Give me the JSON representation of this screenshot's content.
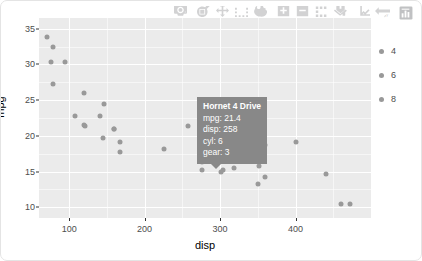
{
  "chart_data": {
    "type": "scatter",
    "title": "",
    "xlabel": "disp",
    "ylabel": "mpg",
    "xlim": [
      60,
      500
    ],
    "ylim": [
      8.5,
      36.5
    ],
    "xticks": [
      "100",
      "200",
      "300",
      "400"
    ],
    "xtick_values": [
      100,
      200,
      300,
      400
    ],
    "yticks": [
      "35",
      "30",
      "25",
      "20",
      "15",
      "10"
    ],
    "ytick_values": [
      35,
      30,
      25,
      20,
      15,
      10
    ],
    "grid": true,
    "legend_position": "right",
    "legend_title": "",
    "series": [
      {
        "name": "4",
        "color": "#999999",
        "points": [
          {
            "label": "Datsun 710",
            "disp": 108,
            "mpg": 22.8,
            "cyl": 4,
            "gear": 4
          },
          {
            "label": "Merc 240D",
            "disp": 146.7,
            "mpg": 24.4,
            "cyl": 4,
            "gear": 4
          },
          {
            "label": "Merc 230",
            "disp": 140.8,
            "mpg": 22.8,
            "cyl": 4,
            "gear": 4
          },
          {
            "label": "Fiat 128",
            "disp": 78.7,
            "mpg": 32.4,
            "cyl": 4,
            "gear": 4
          },
          {
            "label": "Honda Civic",
            "disp": 75.7,
            "mpg": 30.4,
            "cyl": 4,
            "gear": 4
          },
          {
            "label": "Toyota Corolla",
            "disp": 71.1,
            "mpg": 33.9,
            "cyl": 4,
            "gear": 4
          },
          {
            "label": "Toyota Corona",
            "disp": 120.1,
            "mpg": 21.5,
            "cyl": 4,
            "gear": 3
          },
          {
            "label": "Fiat X1-9",
            "disp": 79,
            "mpg": 27.3,
            "cyl": 4,
            "gear": 4
          },
          {
            "label": "Porsche 914-2",
            "disp": 120.3,
            "mpg": 26,
            "cyl": 4,
            "gear": 5
          },
          {
            "label": "Lotus Europa",
            "disp": 95.1,
            "mpg": 30.4,
            "cyl": 4,
            "gear": 5
          },
          {
            "label": "Volvo 142E",
            "disp": 121,
            "mpg": 21.4,
            "cyl": 4,
            "gear": 4
          }
        ]
      },
      {
        "name": "6",
        "color": "#999999",
        "points": [
          {
            "label": "Mazda RX4",
            "disp": 160,
            "mpg": 21,
            "cyl": 6,
            "gear": 4
          },
          {
            "label": "Mazda RX4 Wag",
            "disp": 160,
            "mpg": 21,
            "cyl": 6,
            "gear": 4
          },
          {
            "label": "Hornet 4 Drive",
            "disp": 258,
            "mpg": 21.4,
            "cyl": 6,
            "gear": 3
          },
          {
            "label": "Valiant",
            "disp": 225,
            "mpg": 18.1,
            "cyl": 6,
            "gear": 3
          },
          {
            "label": "Merc 280",
            "disp": 167.6,
            "mpg": 19.2,
            "cyl": 6,
            "gear": 4
          },
          {
            "label": "Merc 280C",
            "disp": 167.6,
            "mpg": 17.8,
            "cyl": 6,
            "gear": 4
          },
          {
            "label": "Ferrari Dino",
            "disp": 145,
            "mpg": 19.7,
            "cyl": 6,
            "gear": 5
          }
        ]
      },
      {
        "name": "8",
        "color": "#999999",
        "points": [
          {
            "label": "Hornet Sportabout",
            "disp": 360,
            "mpg": 18.7,
            "cyl": 8,
            "gear": 3
          },
          {
            "label": "Duster 360",
            "disp": 360,
            "mpg": 14.3,
            "cyl": 8,
            "gear": 3
          },
          {
            "label": "Merc 450SE",
            "disp": 275.8,
            "mpg": 16.4,
            "cyl": 8,
            "gear": 3
          },
          {
            "label": "Merc 450SL",
            "disp": 275.8,
            "mpg": 17.3,
            "cyl": 8,
            "gear": 3
          },
          {
            "label": "Merc 450SLC",
            "disp": 275.8,
            "mpg": 15.2,
            "cyl": 8,
            "gear": 3
          },
          {
            "label": "Cadillac Fleetwood",
            "disp": 472,
            "mpg": 10.4,
            "cyl": 8,
            "gear": 3
          },
          {
            "label": "Lincoln Continental",
            "disp": 460,
            "mpg": 10.4,
            "cyl": 8,
            "gear": 3
          },
          {
            "label": "Chrysler Imperial",
            "disp": 440,
            "mpg": 14.7,
            "cyl": 8,
            "gear": 3
          },
          {
            "label": "Dodge Challenger",
            "disp": 318,
            "mpg": 15.5,
            "cyl": 8,
            "gear": 3
          },
          {
            "label": "AMC Javelin",
            "disp": 304,
            "mpg": 15.2,
            "cyl": 8,
            "gear": 3
          },
          {
            "label": "Camaro Z28",
            "disp": 350,
            "mpg": 13.3,
            "cyl": 8,
            "gear": 3
          },
          {
            "label": "Pontiac Firebird",
            "disp": 400,
            "mpg": 19.2,
            "cyl": 8,
            "gear": 3
          },
          {
            "label": "Ford Pantera L",
            "disp": 351,
            "mpg": 15.8,
            "cyl": 8,
            "gear": 5
          },
          {
            "label": "Maserati Bora",
            "disp": 301,
            "mpg": 15,
            "cyl": 8,
            "gear": 5
          }
        ]
      }
    ]
  },
  "legend": {
    "items": [
      {
        "label": "4",
        "color": "#999999"
      },
      {
        "label": "6",
        "color": "#999999"
      },
      {
        "label": "8",
        "color": "#999999"
      }
    ]
  },
  "tooltip": {
    "title": "Hornet 4 Drive",
    "line_mpg": "mpg: 21.4",
    "line_disp": "disp: 258",
    "line_cyl": "cyl: 6",
    "line_gear": "gear: 3",
    "background": "#888888"
  },
  "modebar": {
    "buttons": [
      {
        "name": "camera-icon",
        "title": "Download plot as a png"
      },
      {
        "name": "zoom-magnifier-icon",
        "title": "Zoom"
      },
      {
        "name": "pan-move-icon",
        "title": "Pan"
      },
      {
        "name": "box-select-icon",
        "title": "Box Select"
      },
      {
        "name": "lasso-select-icon",
        "title": "Lasso Select"
      },
      {
        "name": "zoom-in-icon",
        "title": "Zoom in"
      },
      {
        "name": "zoom-out-icon",
        "title": "Zoom out"
      },
      {
        "name": "autoscale-icon",
        "title": "Autoscale"
      },
      {
        "name": "reset-axes-icon",
        "title": "Reset axes"
      },
      {
        "name": "spike-lines-icon",
        "title": "Toggle Spike Lines"
      },
      {
        "name": "hover-compare-icon",
        "title": "Show closest data on hover"
      },
      {
        "name": "plotly-logo-icon",
        "title": "Produced with Plotly"
      }
    ]
  },
  "axes": {
    "x_title": "disp",
    "y_title": "mpg"
  }
}
